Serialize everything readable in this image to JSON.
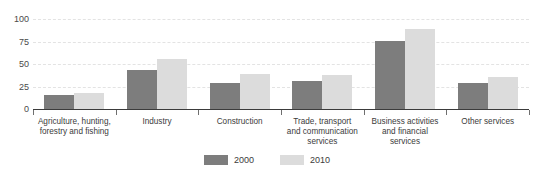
{
  "chart_data": {
    "type": "bar",
    "title": "",
    "xlabel": "",
    "ylabel": "",
    "ylim": [
      0,
      100
    ],
    "yticks": [
      0,
      25,
      50,
      75,
      100
    ],
    "ytick_labels": [
      "0",
      "25",
      "50",
      "75",
      "100"
    ],
    "grid": true,
    "legend_position": "bottom-center",
    "categories": [
      "Agriculture, hunting,\nforestry and fishing",
      "Industry",
      "Construction",
      "Trade, transport\nand communication\nservices",
      "Business activities\nand financial\nservices",
      "Other services"
    ],
    "series": [
      {
        "name": "2000",
        "color": "#7d7d7d",
        "values": [
          16,
          43,
          29,
          31,
          76,
          29
        ]
      },
      {
        "name": "2010",
        "color": "#dcdcdc",
        "values": [
          18,
          56,
          39,
          38,
          89,
          36
        ]
      }
    ]
  },
  "legend": {
    "items": [
      {
        "label": "2000",
        "swatch": "dark-gray-swatch"
      },
      {
        "label": "2010",
        "swatch": "light-gray-swatch"
      }
    ]
  },
  "top_caption": {
    "text": ""
  }
}
